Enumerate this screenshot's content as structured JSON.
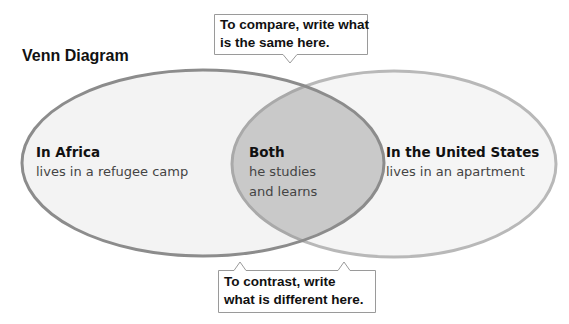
{
  "title": "Venn Diagram",
  "callouts": {
    "compare": {
      "line1": "To compare, write what",
      "line2": "is the same here."
    },
    "contrast": {
      "line1": "To contrast, write",
      "line2": "what is different here."
    }
  },
  "sets": {
    "left": {
      "heading": "In Africa",
      "body": "lives in a refugee camp"
    },
    "both": {
      "heading": "Both",
      "body1": "he studies",
      "body2": "and learns"
    },
    "right": {
      "heading": "In the United States",
      "body": "lives in an apartment"
    }
  },
  "colors": {
    "ellipse_fill": "#f4f4f4",
    "overlap_fill": "#c8c8c8",
    "left_stroke": "#8a8a8a",
    "right_stroke": "#b5b5b5",
    "callout_border": "#999999"
  }
}
